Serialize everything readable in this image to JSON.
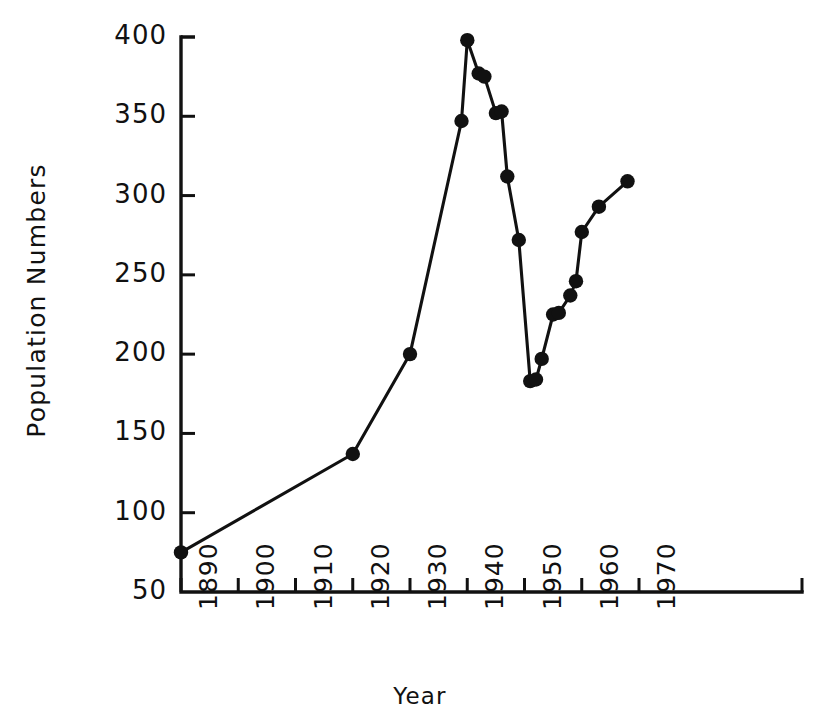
{
  "chart_data": {
    "type": "line",
    "title": "",
    "xlabel": "Year",
    "ylabel": "Population Numbers",
    "xlim": [
      1890,
      1970
    ],
    "ylim": [
      50,
      400
    ],
    "grid": false,
    "legend": null,
    "x_ticks": [
      1890,
      1900,
      1910,
      1920,
      1930,
      1940,
      1950,
      1960,
      1970
    ],
    "x_tick_labels": [
      "1890",
      "1900",
      "1910",
      "1920",
      "1930",
      "1940",
      "1950",
      "1960",
      "1970"
    ],
    "y_ticks": [
      50,
      100,
      150,
      200,
      250,
      300,
      350,
      400
    ],
    "y_tick_labels": [
      "50",
      "100",
      "150",
      "200",
      "250",
      "300",
      "350",
      "400"
    ],
    "series": [
      {
        "name": "Population Numbers",
        "marker": "filled-circle",
        "color": "#111111",
        "points": [
          {
            "x": 1890,
            "y": 75
          },
          {
            "x": 1920,
            "y": 137
          },
          {
            "x": 1930,
            "y": 200
          },
          {
            "x": 1939,
            "y": 347
          },
          {
            "x": 1940,
            "y": 398
          },
          {
            "x": 1942,
            "y": 377
          },
          {
            "x": 1943,
            "y": 375
          },
          {
            "x": 1945,
            "y": 352
          },
          {
            "x": 1946,
            "y": 353
          },
          {
            "x": 1947,
            "y": 312
          },
          {
            "x": 1949,
            "y": 272
          },
          {
            "x": 1951,
            "y": 183
          },
          {
            "x": 1952,
            "y": 184
          },
          {
            "x": 1953,
            "y": 197
          },
          {
            "x": 1955,
            "y": 225
          },
          {
            "x": 1956,
            "y": 226
          },
          {
            "x": 1958,
            "y": 237
          },
          {
            "x": 1959,
            "y": 246
          },
          {
            "x": 1960,
            "y": 277
          },
          {
            "x": 1963,
            "y": 293
          },
          {
            "x": 1968,
            "y": 309
          }
        ]
      }
    ]
  },
  "axes": {
    "x_axis_title": "Year",
    "y_axis_title": "Population Numbers"
  }
}
